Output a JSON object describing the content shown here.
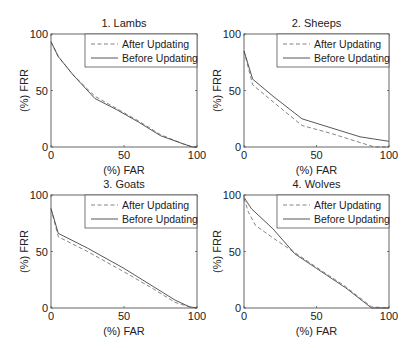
{
  "figure": {
    "legend": {
      "after_label": "After Updating",
      "before_label": "Before Updating"
    },
    "colors": {
      "axis": "#555555",
      "after_line": "#777777",
      "before_line": "#444444",
      "background": "#ffffff"
    }
  },
  "chart_data": [
    {
      "type": "line",
      "title": "1. Lambs",
      "xlabel": "(%) FAR",
      "ylabel": "(%) FRR",
      "xlim": [
        0,
        100
      ],
      "ylim": [
        0,
        100
      ],
      "xticks": [
        0,
        50,
        100
      ],
      "yticks": [
        0,
        50,
        100
      ],
      "grid": false,
      "legend_position": "upper right",
      "series": [
        {
          "name": "After Updating",
          "style": "dashed",
          "x": [
            0,
            5,
            15,
            30,
            45,
            60,
            75,
            90,
            97,
            100
          ],
          "y": [
            93,
            80,
            64,
            45,
            34,
            23,
            11,
            3,
            0,
            0
          ]
        },
        {
          "name": "Before Updating",
          "style": "solid",
          "x": [
            0,
            5,
            15,
            30,
            45,
            60,
            75,
            90,
            97,
            100
          ],
          "y": [
            93,
            80,
            64,
            43,
            33,
            22,
            10,
            3,
            0,
            0
          ]
        }
      ]
    },
    {
      "type": "line",
      "title": "2. Sheeps",
      "xlabel": "(%) FAR",
      "ylabel": "(%) FRR",
      "xlim": [
        0,
        100
      ],
      "ylim": [
        0,
        100
      ],
      "xticks": [
        0,
        50,
        100
      ],
      "yticks": [
        0,
        50,
        100
      ],
      "grid": false,
      "legend_position": "upper right",
      "series": [
        {
          "name": "After Updating",
          "style": "dashed",
          "x": [
            0,
            6,
            20,
            40,
            60,
            80,
            90,
            100
          ],
          "y": [
            85,
            55,
            40,
            19,
            12,
            4,
            0,
            0
          ]
        },
        {
          "name": "Before Updating",
          "style": "solid",
          "x": [
            0,
            6,
            20,
            40,
            60,
            80,
            90,
            100
          ],
          "y": [
            85,
            60,
            45,
            25,
            17,
            9,
            7,
            5
          ]
        }
      ]
    },
    {
      "type": "line",
      "title": "3. Goats",
      "xlabel": "(%) FAR",
      "ylabel": "(%) FRR",
      "xlim": [
        0,
        100
      ],
      "ylim": [
        0,
        100
      ],
      "xticks": [
        0,
        50,
        100
      ],
      "yticks": [
        0,
        50,
        100
      ],
      "grid": false,
      "legend_position": "upper right",
      "series": [
        {
          "name": "After Updating",
          "style": "dashed",
          "x": [
            0,
            5,
            25,
            50,
            70,
            85,
            95,
            100
          ],
          "y": [
            88,
            63,
            50,
            32,
            17,
            5,
            1,
            0
          ]
        },
        {
          "name": "Before Updating",
          "style": "solid",
          "x": [
            0,
            5,
            25,
            50,
            70,
            85,
            95,
            100
          ],
          "y": [
            88,
            66,
            53,
            35,
            19,
            7,
            1,
            0
          ]
        }
      ]
    },
    {
      "type": "line",
      "title": "4. Wolves",
      "xlabel": "(%) FAR",
      "ylabel": "(%) FRR",
      "xlim": [
        0,
        100
      ],
      "ylim": [
        0,
        100
      ],
      "xticks": [
        0,
        50,
        100
      ],
      "yticks": [
        0,
        50,
        100
      ],
      "grid": false,
      "legend_position": "upper right",
      "series": [
        {
          "name": "After Updating",
          "style": "dashed",
          "x": [
            0,
            3,
            8,
            20,
            35,
            50,
            70,
            88,
            100
          ],
          "y": [
            97,
            85,
            73,
            62,
            49,
            36,
            19,
            1,
            0
          ]
        },
        {
          "name": "Before Updating",
          "style": "solid",
          "x": [
            0,
            5,
            20,
            35,
            50,
            70,
            88,
            100
          ],
          "y": [
            98,
            88,
            70,
            48,
            35,
            18,
            0,
            0
          ]
        }
      ]
    }
  ]
}
